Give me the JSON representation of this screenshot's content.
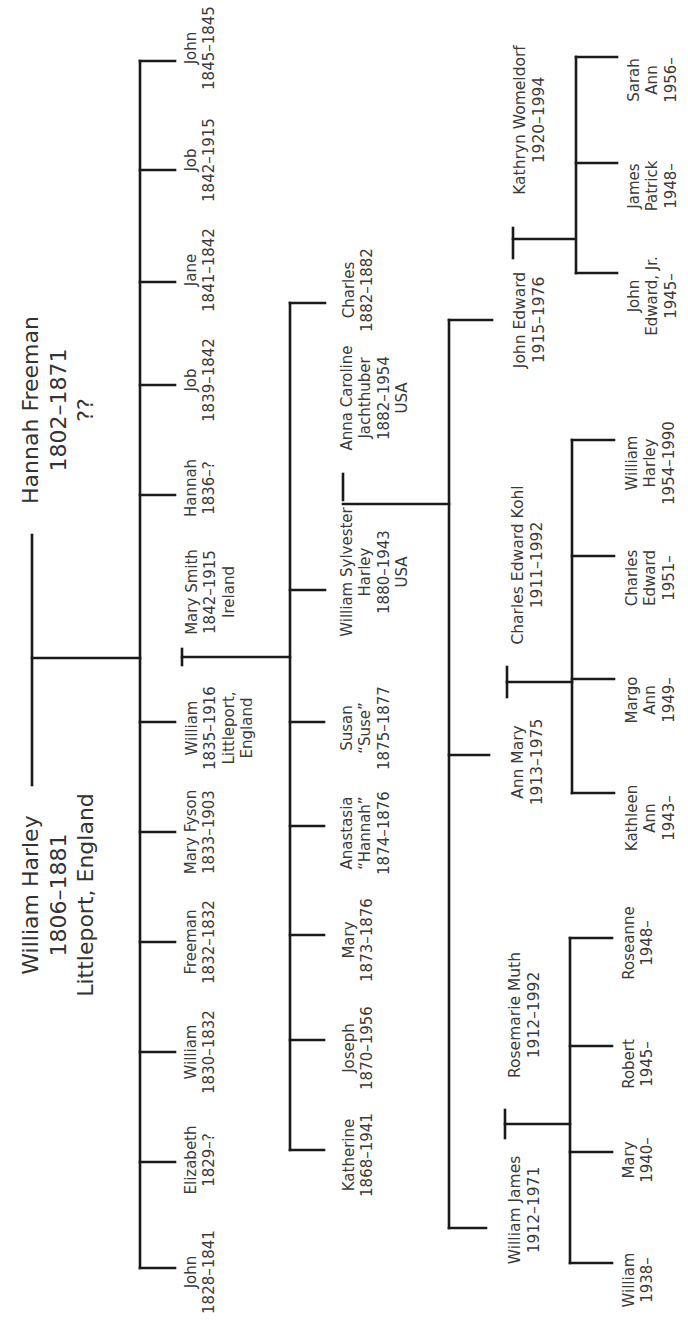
{
  "diagram": {
    "type": "family-tree",
    "orientation": "rotated-90-ccw",
    "line_color": "#1a1a1a",
    "text_color": "#3a3a3a"
  },
  "gen1": {
    "father": {
      "name": "William Harley",
      "dates": "1806–1881",
      "place": "Littleport, England"
    },
    "mother": {
      "name": "Hannah Freeman",
      "dates": "1802–1871",
      "place": "??"
    }
  },
  "gen2": [
    {
      "name": "John",
      "dates": "1845–1845"
    },
    {
      "name": "Job",
      "dates": "1842–1915"
    },
    {
      "name": "Jane",
      "dates": "1841–1842"
    },
    {
      "name": "Job",
      "dates": "1839–1842"
    },
    {
      "name": "Hannah",
      "dates": "1836–?"
    },
    {
      "name": "William",
      "dates": "1835–1916",
      "place1": "Littleport,",
      "place2": "England"
    },
    {
      "name": "Mary Fyson",
      "dates": "1833–1903"
    },
    {
      "name": "Freeman",
      "dates": "1832–1832"
    },
    {
      "name": "William",
      "dates": "1830–1832"
    },
    {
      "name": "Elizabeth",
      "dates": "1829–?"
    },
    {
      "name": "John",
      "dates": "1828–1841"
    }
  ],
  "gen2_spouse": {
    "name": "Mary Smith",
    "dates": "1842–1915",
    "place": "Ireland"
  },
  "gen3": [
    {
      "name": "Charles",
      "dates": "1882–1882"
    },
    {
      "name": "William Sylvester",
      "name2": "Harley",
      "dates": "1880–1943",
      "place": "USA"
    },
    {
      "name": "Susan",
      "nickname": "“Suse”",
      "dates": "1875–1877"
    },
    {
      "name": "Anastasia",
      "nickname": "“Hannah”",
      "dates": "1874–1876"
    },
    {
      "name": "Mary",
      "dates": "1873–1876"
    },
    {
      "name": "Joseph",
      "dates": "1870–1956"
    },
    {
      "name": "Katherine",
      "dates": "1868–1941"
    }
  ],
  "gen3_spouse": {
    "name": "Anna Caroline",
    "name2": "Jachthuber",
    "dates": "1882–1954",
    "place": "USA"
  },
  "gen4": [
    {
      "name": "John Edward",
      "dates": "1915–1976",
      "spouse": {
        "name": "Kathryn Womeldorf",
        "dates": "1920–1994"
      },
      "children": [
        {
          "line1": "John",
          "line2": "Edward, Jr.",
          "line3": "1945–"
        },
        {
          "line1": "James",
          "line2": "Patrick",
          "line3": "1948–"
        },
        {
          "line1": "Sarah",
          "line2": "Ann",
          "line3": "1956–"
        }
      ]
    },
    {
      "name": "Ann Mary",
      "dates": "1913–1975",
      "spouse": {
        "name": "Charles Edward Kohl",
        "dates": "1911–1992"
      },
      "children": [
        {
          "line1": "Kathleen",
          "line2": "Ann",
          "line3": "1943–"
        },
        {
          "line1": "Margo",
          "line2": "Ann",
          "line3": "1949–"
        },
        {
          "line1": "Charles",
          "line2": "Edward",
          "line3": "1951–"
        },
        {
          "line1": "William",
          "line2": "Harley",
          "line3": "1954–1990"
        }
      ]
    },
    {
      "name": "William James",
      "dates": "1912–1971",
      "spouse": {
        "name": "Rosemarie Muth",
        "dates": "1912–1992"
      },
      "children": [
        {
          "line1": "William",
          "line2": "1938–"
        },
        {
          "line1": "Mary",
          "line2": "1940–"
        },
        {
          "line1": "Robert",
          "line2": "1945–"
        },
        {
          "line1": "Roseanne",
          "line2": "1948–"
        }
      ]
    }
  ]
}
